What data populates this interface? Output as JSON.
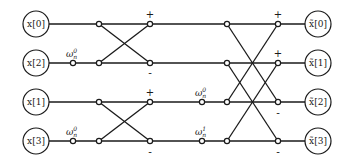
{
  "diagram": {
    "type": "fft-butterfly",
    "inputs": [
      "x[0]",
      "x[2]",
      "x[1]",
      "x[3]"
    ],
    "outputs": [
      "x̃[0]",
      "x̃[1]",
      "x̃[2]",
      "x̃[3]"
    ],
    "stage1": {
      "twiddles": [
        {
          "row": 1,
          "base": "ω",
          "sup": "0",
          "sub": "n"
        },
        {
          "row": 3,
          "base": "ω",
          "sup": "0",
          "sub": "n"
        }
      ],
      "signs": [
        {
          "label": "+",
          "row": 0
        },
        {
          "label": "-",
          "row": 1
        },
        {
          "label": "+",
          "row": 2
        },
        {
          "label": "-",
          "row": 3
        }
      ]
    },
    "stage2": {
      "twiddles": [
        {
          "row": 2,
          "base": "ω",
          "sup": "0",
          "sub": "n"
        },
        {
          "row": 3,
          "base": "ω",
          "sup": "1",
          "sub": "n"
        }
      ],
      "signs": [
        {
          "label": "+",
          "row": 0
        },
        {
          "label": "+",
          "row": 1
        },
        {
          "label": "-",
          "row": 2
        },
        {
          "label": "-",
          "row": 3
        }
      ]
    },
    "colors": {
      "line": "#1a1a1a",
      "background": "#ffffff"
    }
  }
}
